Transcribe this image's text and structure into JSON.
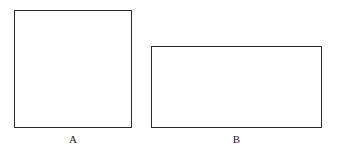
{
  "figure": {
    "background_color": "#ffffff",
    "stroke_color": "#2b2b2b",
    "label_color": "#1a1a1a",
    "shapes": [
      {
        "id": "a",
        "kind": "square",
        "label": "A",
        "x": 14,
        "y": 10,
        "width": 118,
        "height": 118,
        "fill": "none",
        "stroke_width": 1
      },
      {
        "id": "b",
        "kind": "rectangle",
        "label": "B",
        "x": 151,
        "y": 46,
        "width": 171,
        "height": 82,
        "fill": "none",
        "stroke_width": 1
      }
    ]
  }
}
